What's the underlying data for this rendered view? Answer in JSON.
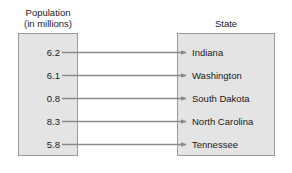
{
  "diagram": {
    "type": "mapping-diagram",
    "domain_header": "Population\n(in millions)",
    "range_header": "State",
    "colors": {
      "box_fill": "#e4e4e4",
      "box_border": "#9a9a9a",
      "arrow": "#8a8a8a",
      "text": "#1a1a1a",
      "background": "#ffffff"
    },
    "pairs": [
      {
        "population": "6.2",
        "state": "Indiana"
      },
      {
        "population": "6.1",
        "state": "Washington"
      },
      {
        "population": "0.8",
        "state": "South Dakota"
      },
      {
        "population": "8.3",
        "state": "North Carolina"
      },
      {
        "population": "5.8",
        "state": "Tennessee"
      }
    ]
  }
}
